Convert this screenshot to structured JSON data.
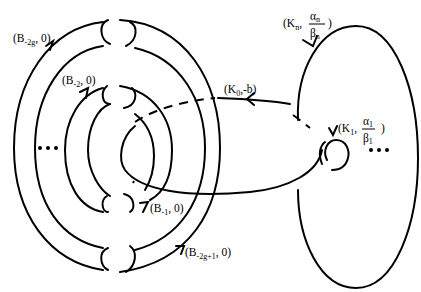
{
  "figure": {
    "type": "surgery diagram",
    "labels": {
      "b_neg2g": {
        "base": "(B",
        "sub": "-2g",
        "rest": ", 0)"
      },
      "b_neg2": {
        "base": "(B",
        "sub": "-2",
        "rest": ", 0)"
      },
      "b_neg1": {
        "base": "(B",
        "sub": "-1",
        "rest": ", 0)"
      },
      "b_neg2g1": {
        "base": "(B",
        "sub": "-2g+1",
        "rest": ", 0)"
      },
      "k0": {
        "base": "(K",
        "sub": "0",
        "rest": ",-b)"
      },
      "kn": {
        "base": "(K",
        "sub": "n",
        "comma": ",",
        "num": "α",
        "num_sub": "n",
        "den": "β",
        "den_sub": "n",
        "close": ")"
      },
      "k1": {
        "base": "(K",
        "sub": "1",
        "comma": ",",
        "num": "α",
        "num_sub": "1",
        "den": "β",
        "den_sub": "1",
        "close": ")"
      }
    },
    "ellipsis_left": "•••",
    "ellipsis_right": "•••"
  }
}
